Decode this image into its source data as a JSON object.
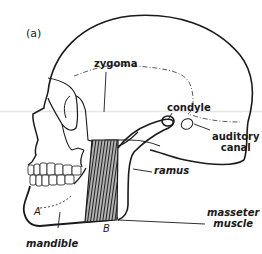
{
  "figure": {
    "panel_label": "(a)",
    "labels": {
      "zygoma": "zygoma",
      "condyle": "condyle",
      "auditory_canal_line1": "auditory",
      "auditory_canal_line2": "canal",
      "ramus": "ramus",
      "masseter_line1": "masseter",
      "masseter_line2": "muscle",
      "mandible": "mandible",
      "point_a": "A",
      "point_b": "B"
    },
    "colors": {
      "ink": "#1a1a1a",
      "background": "#ffffff",
      "muscle_fill": "#3a3a3a"
    }
  }
}
